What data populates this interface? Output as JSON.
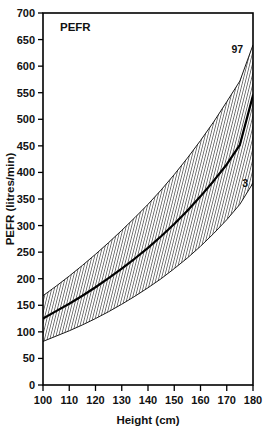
{
  "figure": {
    "panel_label": "PEFR",
    "background_color": "#ffffff",
    "ink_color": "#000000"
  },
  "chart_data": {
    "type": "line",
    "title": "PEFR",
    "xlabel": "Height (cm)",
    "ylabel": "PEFR (litres/min)",
    "xlim": [
      100,
      180
    ],
    "ylim": [
      0,
      700
    ],
    "xticks": [
      100,
      110,
      120,
      130,
      140,
      150,
      160,
      170,
      180
    ],
    "xtick_labels": [
      "100",
      "110",
      "120",
      "130",
      "140",
      "150",
      "160",
      "170",
      "180"
    ],
    "yticks": [
      0,
      50,
      100,
      150,
      200,
      250,
      300,
      350,
      400,
      450,
      500,
      550,
      600,
      650,
      700
    ],
    "ytick_labels": [
      "0",
      "50",
      "100",
      "150",
      "200",
      "250",
      "300",
      "350",
      "400",
      "450",
      "500",
      "550",
      "600",
      "650",
      "700"
    ],
    "grid": false,
    "legend_position": "inline-annotations",
    "x": [
      100,
      105,
      110,
      115,
      120,
      125,
      130,
      135,
      140,
      145,
      150,
      155,
      160,
      165,
      170,
      175,
      180
    ],
    "series": [
      {
        "name": "97th centile",
        "annotation": "97",
        "style": "hatched-band-upper-edge",
        "values": [
          168,
          186,
          205,
          225,
          246,
          268,
          291,
          315,
          340,
          367,
          396,
          427,
          460,
          495,
          533,
          572,
          640
        ]
      },
      {
        "name": "50th centile",
        "annotation": "",
        "style": "solid-line",
        "values": [
          125,
          139,
          153,
          168,
          184,
          201,
          219,
          238,
          258,
          280,
          303,
          328,
          355,
          384,
          415,
          452,
          545
        ]
      },
      {
        "name": "3rd centile",
        "annotation": "3",
        "style": "hatched-band-lower-edge",
        "values": [
          82,
          92,
          102,
          113,
          125,
          138,
          152,
          167,
          183,
          200,
          219,
          239,
          261,
          285,
          311,
          340,
          380
        ]
      }
    ],
    "band": {
      "fill_pattern": "diagonal-hatch",
      "between": [
        "3rd centile",
        "97th centile"
      ]
    },
    "annotations": [
      {
        "text": "97",
        "x": 174,
        "y": 625,
        "series": "97th centile"
      },
      {
        "text": "3",
        "x": 177,
        "y": 373,
        "series": "3rd centile"
      },
      {
        "text": "PEFR",
        "x": 106,
        "y": 672,
        "role": "panel-label"
      }
    ]
  }
}
